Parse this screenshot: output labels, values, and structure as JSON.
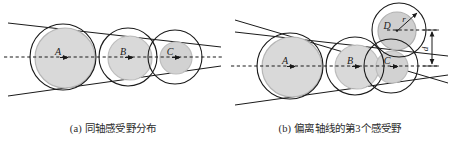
{
  "figure": {
    "panels": [
      {
        "id": "a",
        "caption": "(a) 同轴感受野分布",
        "labels": [
          {
            "name": "A",
            "text": "A",
            "x": 63,
            "y": 57
          },
          {
            "name": "B",
            "text": "B",
            "x": 128,
            "y": 57
          },
          {
            "name": "C",
            "text": "C",
            "x": 175,
            "y": 57
          }
        ],
        "receptive_fields": [
          {
            "label": "A",
            "outer_cx": 63,
            "outer_cy": 57,
            "outer_r": 33,
            "inner_cx": 65,
            "inner_cy": 58,
            "inner_r": 30
          },
          {
            "label": "B",
            "outer_cx": 128,
            "outer_cy": 57,
            "outer_r": 29,
            "inner_cx": 130,
            "inner_cy": 58,
            "inner_r": 22
          },
          {
            "label": "C",
            "outer_cx": 175,
            "outer_cy": 57,
            "outer_r": 27,
            "inner_cx": 176,
            "inner_cy": 58,
            "inner_r": 16
          }
        ],
        "axis": {
          "name": "optical-axis",
          "x1": 4,
          "y1": 57,
          "x2": 222,
          "y2": 57
        },
        "cone_lines": [
          {
            "name": "cone-line-upper",
            "x1": 8,
            "y1": 23,
            "x2": 221,
            "y2": 47
          },
          {
            "name": "cone-line-lower",
            "x1": 8,
            "y1": 96,
            "x2": 221,
            "y2": 66
          }
        ]
      },
      {
        "id": "b",
        "caption": "(b) 偏离轴线的第3个感受野",
        "labels": [
          {
            "name": "A",
            "text": "A",
            "x": 65,
            "y": 66
          },
          {
            "name": "B",
            "text": "B",
            "x": 128,
            "y": 66
          },
          {
            "name": "C",
            "text": "C",
            "x": 166,
            "y": 66
          },
          {
            "name": "D",
            "text": "D",
            "x": 160,
            "y": 29
          },
          {
            "name": "r",
            "text": "r",
            "x": 177,
            "y": 22
          },
          {
            "name": "d",
            "text": "d",
            "x": 208,
            "y": 48
          }
        ],
        "receptive_fields": [
          {
            "label": "A",
            "outer_cx": 63,
            "outer_cy": 66,
            "outer_r": 33,
            "inner_cx": 65,
            "inner_cy": 67,
            "inner_r": 30
          },
          {
            "label": "B",
            "outer_cx": 128,
            "outer_cy": 66,
            "outer_r": 29,
            "inner_cx": 130,
            "inner_cy": 67,
            "inner_r": 22
          },
          {
            "label": "C",
            "outer_cx": 164,
            "outer_cy": 66,
            "outer_r": 27,
            "inner_cx": 165,
            "inner_cy": 67,
            "inner_r": 16
          },
          {
            "label": "D",
            "outer_cx": 172,
            "outer_cy": 30,
            "outer_r": 27,
            "inner_cx": 170,
            "inner_cy": 31,
            "inner_r": 19
          }
        ],
        "axis": {
          "name": "optical-axis",
          "x1": 4,
          "y1": 66,
          "x2": 222,
          "y2": 66
        },
        "offset_axis": {
          "name": "offset-axis",
          "x1": 160,
          "y1": 30,
          "x2": 212,
          "y2": 30
        },
        "cone_lines": [
          {
            "name": "cone-line-upper",
            "x1": 8,
            "y1": 32,
            "x2": 221,
            "y2": 56
          },
          {
            "name": "cone-line-lower",
            "x1": 8,
            "y1": 105,
            "x2": 221,
            "y2": 75
          },
          {
            "name": "cone-line-tilted",
            "x1": 8,
            "y1": 17,
            "x2": 221,
            "y2": 80
          }
        ],
        "dimension": {
          "name": "offset-distance-d",
          "symbol": "d",
          "x": 205,
          "y_top": 30,
          "y_bottom": 66
        },
        "radius_arrow": {
          "name": "radius-r",
          "symbol": "r",
          "from_x": 170,
          "from_y": 31,
          "to_x": 189,
          "to_y": 13
        }
      }
    ]
  },
  "style": {
    "fill_gray": "#d9d9d9",
    "fill_gray_stroke": "#b0b0b0",
    "stroke_black": "#1a1a1a",
    "background": "#ffffff",
    "caption_color": "#2b2b2b"
  }
}
